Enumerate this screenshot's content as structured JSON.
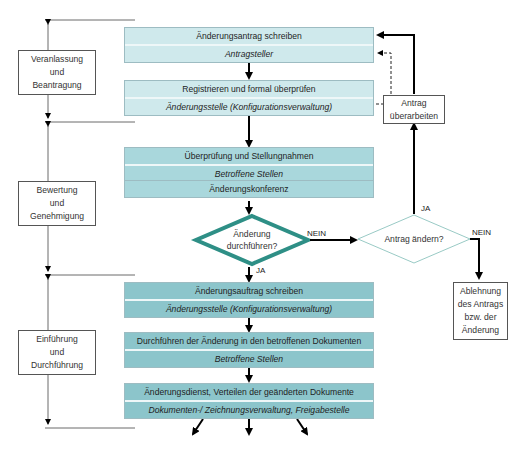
{
  "phases": [
    {
      "label": "Veranlassung und Beantragung",
      "lines": [
        "Veranlassung",
        "und",
        "Beantragung"
      ]
    },
    {
      "label": "Bewertung und Genehmigung",
      "lines": [
        "Bewertung",
        "und",
        "Genehmigung"
      ]
    },
    {
      "label": "Einführung und Durchführung",
      "lines": [
        "Einführung",
        "und",
        "Durchführung"
      ]
    }
  ],
  "steps": [
    {
      "title": "Änderungsantrag schreiben",
      "actor": "Antragsteller"
    },
    {
      "title": "Registrieren und formal überprüfen",
      "actor": "Änderungsstelle (Konfigurationsverwaltung)"
    },
    {
      "title": "Überprüfung und Stellungnahmen",
      "actor": "Betroffene Stellen"
    },
    {
      "title": "Änderungskonferenz"
    },
    {
      "title": "Änderungsauftrag schreiben",
      "actor": "Änderungsstelle (Konfigurationsverwaltung)"
    },
    {
      "title": "Durchführen der Änderung in den betroffenen Dokumenten",
      "actor": "Betroffene Stellen"
    },
    {
      "title": "Änderungsdienst, Verteilen der geänderten Dokumente",
      "actor": "Dokumenten-/ Zeichnungsverwaltung, Freigabestelle"
    }
  ],
  "decisions": {
    "main": {
      "lines": [
        "Änderung",
        "durchführen?"
      ],
      "color": "#2e8f86"
    },
    "secondary": {
      "lines": [
        "Antrag ändern?"
      ],
      "color": "#7fbdb6"
    }
  },
  "side_boxes": {
    "revise": {
      "lines": [
        "Antrag",
        "überarbeiten"
      ]
    },
    "reject": {
      "lines": [
        "Ablehnung",
        "des Antrags",
        "bzw. der",
        "Änderung"
      ]
    }
  },
  "edge_labels": {
    "main_no": "NEIN",
    "main_yes": "JA",
    "secondary_yes": "JA",
    "secondary_no": "NEIN"
  },
  "colors": {
    "box_light": "#cfe9ec",
    "box_mid": "#a9d7dc",
    "box_dark": "#8cc5cb",
    "decision_main": "#2e8f86"
  }
}
